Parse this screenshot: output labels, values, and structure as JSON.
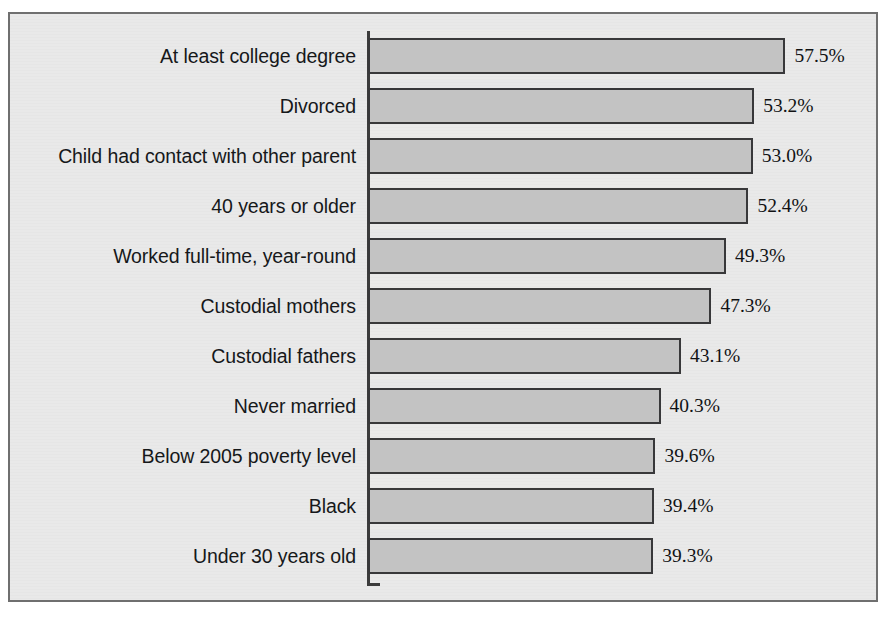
{
  "chart_data": {
    "type": "bar",
    "orientation": "horizontal",
    "title": "",
    "subtitle": "",
    "xlabel": "",
    "ylabel": "",
    "xlim": [
      0,
      60
    ],
    "grid": false,
    "legend": null,
    "value_suffix": "%",
    "categories": [
      "At least college degree",
      "Divorced",
      "Child had contact with other parent",
      "40 years or older",
      "Worked full-time, year-round",
      "Custodial mothers",
      "Custodial fathers",
      "Never married",
      "Below 2005 poverty level",
      "Black",
      "Under 30 years old"
    ],
    "values": [
      57.5,
      53.2,
      53.0,
      52.4,
      49.3,
      47.3,
      43.1,
      40.3,
      39.6,
      39.4,
      39.3
    ],
    "value_labels": [
      "57.5%",
      "53.2%",
      "53.0%",
      "52.4%",
      "49.3%",
      "47.3%",
      "43.1%",
      "40.3%",
      "39.6%",
      "39.4%",
      "39.3%"
    ],
    "bars": [
      {
        "category": "At least college degree",
        "value": 57.5,
        "label": "57.5%"
      },
      {
        "category": "Divorced",
        "value": 53.2,
        "label": "53.2%"
      },
      {
        "category": "Child had contact with other parent",
        "value": 53.0,
        "label": "53.0%"
      },
      {
        "category": "40 years or older",
        "value": 52.4,
        "label": "52.4%"
      },
      {
        "category": "Worked full-time, year-round",
        "value": 49.3,
        "label": "49.3%"
      },
      {
        "category": "Custodial mothers",
        "value": 47.3,
        "label": "47.3%"
      },
      {
        "category": "Custodial fathers",
        "value": 43.1,
        "label": "43.1%"
      },
      {
        "category": "Never married",
        "value": 40.3,
        "label": "40.3%"
      },
      {
        "category": "Below 2005 poverty level",
        "value": 39.6,
        "label": "39.6%"
      },
      {
        "category": "Black",
        "value": 39.4,
        "label": "39.4%"
      },
      {
        "category": "Under 30 years old",
        "value": 39.3,
        "label": "39.3%"
      }
    ],
    "colors": {
      "bar_fill": "#c3c3c3",
      "bar_border": "#38383a",
      "plot_background": "#e9e9e9",
      "frame_border": "#6f6f6f",
      "axis_line": "#3b3b3b",
      "label_text": "#16181a",
      "value_text": "#111214"
    }
  }
}
